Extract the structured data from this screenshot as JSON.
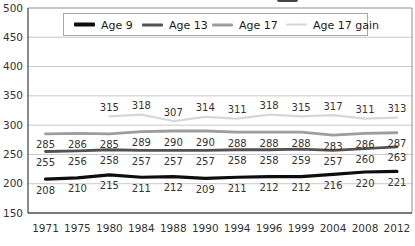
{
  "chart_data": {
    "type": "line",
    "categories": [
      "1971",
      "1975",
      "1980",
      "1984",
      "1988",
      "1990",
      "1994",
      "1996",
      "1999",
      "2004",
      "2008",
      "2012"
    ],
    "yticks": [
      500,
      450,
      400,
      350,
      300,
      250,
      200,
      150
    ],
    "ylim": [
      150,
      500
    ],
    "grid": true,
    "legend_position": "top-center-inside",
    "series": [
      {
        "name": "Age 9",
        "color": "#0d0d0d",
        "width": 3.2,
        "label_side": "below",
        "values": [
          208,
          210,
          215,
          211,
          212,
          209,
          211,
          212,
          212,
          216,
          220,
          221
        ]
      },
      {
        "name": "Age 13",
        "color": "#525252",
        "width": 2.8,
        "label_side": "below",
        "values": [
          255,
          256,
          258,
          257,
          257,
          257,
          258,
          258,
          259,
          257,
          260,
          263
        ]
      },
      {
        "name": "Age 17",
        "color": "#9d9d9d",
        "width": 2.8,
        "label_side": "below",
        "values": [
          285,
          286,
          285,
          289,
          290,
          290,
          288,
          288,
          288,
          283,
          286,
          287
        ]
      },
      {
        "name": "Age 17 gain",
        "color": "#d7d7d7",
        "width": 2.2,
        "label_side": "above",
        "values": [
          null,
          null,
          315,
          318,
          307,
          314,
          311,
          318,
          315,
          317,
          311,
          313
        ]
      }
    ]
  }
}
